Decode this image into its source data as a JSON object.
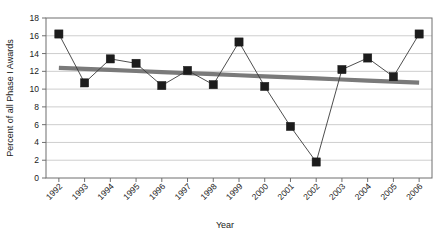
{
  "chart_data": {
    "type": "line",
    "title": "",
    "xlabel": "Year",
    "ylabel": "Percent  of all Phase I Awards",
    "categories": [
      "1992",
      "1993",
      "1994",
      "1995",
      "1996",
      "1997",
      "1998",
      "1999",
      "2000",
      "2001",
      "2002",
      "2003",
      "2004",
      "2005",
      "2006"
    ],
    "x": [
      1992,
      1993,
      1994,
      1995,
      1996,
      1997,
      1998,
      1999,
      2000,
      2001,
      2002,
      2003,
      2004,
      2005,
      2006
    ],
    "series": [
      {
        "name": "Percent of all Phase I Awards",
        "marker": "square",
        "color": "#1c1c1c",
        "values": [
          16.2,
          10.7,
          13.4,
          12.9,
          10.4,
          12.1,
          10.5,
          15.3,
          10.3,
          5.8,
          1.8,
          12.2,
          13.5,
          11.4,
          16.2
        ]
      },
      {
        "name": "Linear trend",
        "marker": "none",
        "color": "#7a7a7a",
        "type": "trend",
        "values": [
          12.4,
          12.28,
          12.16,
          12.04,
          11.92,
          11.8,
          11.68,
          11.56,
          11.44,
          11.32,
          11.2,
          11.08,
          10.96,
          10.84,
          10.72
        ]
      }
    ],
    "ylim": [
      0,
      18
    ],
    "yticks": [
      0,
      2,
      4,
      6,
      8,
      10,
      12,
      14,
      16,
      18
    ],
    "ytick_labels": [
      "0",
      "2",
      "4",
      "6",
      "8",
      "10",
      "12",
      "14",
      "16",
      "18"
    ],
    "xlim": [
      1992,
      2006
    ],
    "grid": "horizontal",
    "legend": "none",
    "xtick_rotation": 45
  },
  "axes": {
    "y_title": "Percent  of all Phase I Awards",
    "x_title": "Year"
  }
}
